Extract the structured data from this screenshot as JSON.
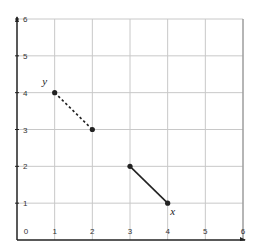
{
  "chart_data": {
    "type": "line",
    "title": "",
    "xlabel": "",
    "ylabel": "",
    "xlim": [
      0,
      6
    ],
    "ylim": [
      0,
      6
    ],
    "grid": true,
    "x_ticks": [
      "0",
      "1",
      "2",
      "3",
      "4",
      "5",
      "6"
    ],
    "y_ticks": [
      "1",
      "2",
      "3",
      "4",
      "5",
      "6"
    ],
    "series": [
      {
        "name": "y",
        "style": "dashed",
        "points": [
          [
            1,
            4
          ],
          [
            2,
            3
          ]
        ],
        "label_position": "near first point"
      },
      {
        "name": "x",
        "style": "solid",
        "points": [
          [
            3,
            2
          ],
          [
            4,
            1
          ]
        ],
        "label_position": "near last point"
      }
    ],
    "colors": {
      "line": "#222222",
      "grid": "#c8c8c8",
      "axis": "#222222"
    }
  }
}
